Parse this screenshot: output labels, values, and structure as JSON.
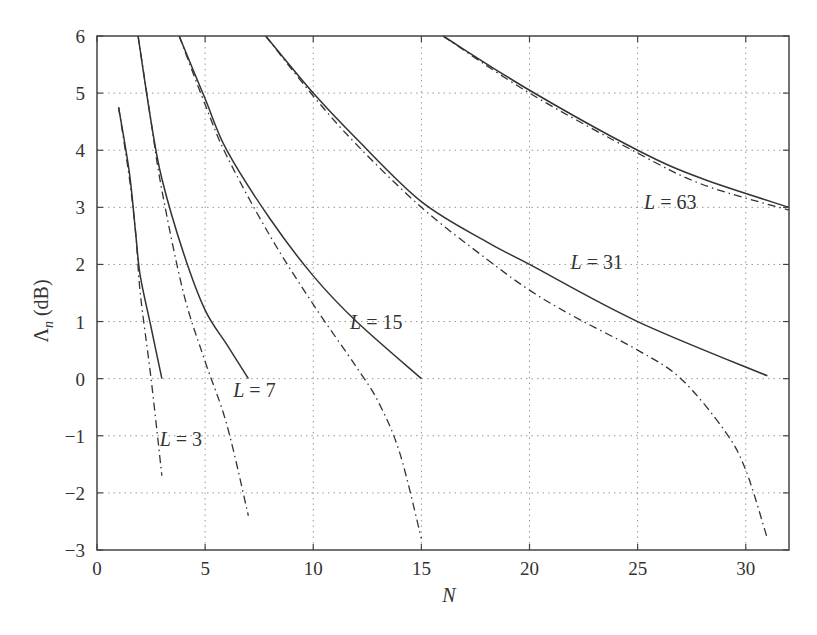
{
  "chart_data": {
    "type": "line",
    "title": "",
    "xlabel": "N",
    "ylabel": "Λn (dB)",
    "ylabel_main": "Λ",
    "ylabel_sub": "n",
    "ylabel_unit": " (dB)",
    "xlim": [
      0,
      32
    ],
    "ylim": [
      -3,
      6
    ],
    "grid": true,
    "xticks": [
      0,
      5,
      10,
      15,
      20,
      25,
      30
    ],
    "yticks": [
      -3,
      -2,
      -1,
      0,
      1,
      2,
      3,
      4,
      5,
      6
    ],
    "legend": "none (inline curve labels)",
    "series": [
      {
        "name": "L = 3",
        "style": "solid",
        "x": [
          1,
          1.5,
          1.8,
          2,
          2.5,
          3
        ],
        "y": [
          4.75,
          3.6,
          2.5,
          1.8,
          0.9,
          0
        ]
      },
      {
        "name": "L = 3 (dash-dot)",
        "style": "dashdot",
        "x": [
          1,
          1.5,
          1.8,
          2,
          2.5,
          3
        ],
        "y": [
          4.75,
          3.5,
          2.5,
          1.5,
          0,
          -1.7
        ]
      },
      {
        "name": "L = 7",
        "style": "solid",
        "x": [
          1.9,
          2.5,
          3,
          4,
          5,
          6,
          7
        ],
        "y": [
          6,
          4.5,
          3.5,
          2.2,
          1.2,
          0.6,
          0
        ]
      },
      {
        "name": "L = 7 (dash-dot)",
        "style": "dashdot",
        "x": [
          1.9,
          2.5,
          3,
          4,
          5,
          6,
          7
        ],
        "y": [
          6,
          4.5,
          3.3,
          1.5,
          0.3,
          -0.8,
          -2.4
        ]
      },
      {
        "name": "L = 15",
        "style": "solid",
        "x": [
          3.8,
          5,
          6,
          8,
          10,
          12,
          15
        ],
        "y": [
          6,
          4.9,
          4,
          2.8,
          1.8,
          1,
          0
        ]
      },
      {
        "name": "L = 15 (dash-dot)",
        "style": "dashdot",
        "x": [
          3.8,
          5,
          6,
          8,
          10,
          12,
          13,
          14,
          15
        ],
        "y": [
          6,
          4.8,
          3.9,
          2.5,
          1.3,
          0.2,
          -0.4,
          -1.3,
          -2.8
        ]
      },
      {
        "name": "L = 31",
        "style": "solid",
        "x": [
          7.8,
          10,
          12,
          15,
          18,
          20,
          25,
          31
        ],
        "y": [
          6,
          5,
          4.2,
          3.1,
          2.4,
          2,
          1,
          0.05
        ]
      },
      {
        "name": "L = 31 (dash-dot)",
        "style": "dashdot",
        "x": [
          7.8,
          10,
          12,
          15,
          18,
          20,
          22,
          25,
          27,
          29,
          30,
          31
        ],
        "y": [
          6,
          4.95,
          4.1,
          3.0,
          2.1,
          1.55,
          1.1,
          0.5,
          0,
          -0.9,
          -1.6,
          -2.8
        ]
      },
      {
        "name": "L = 63",
        "style": "solid",
        "x": [
          16,
          20,
          25,
          28,
          32
        ],
        "y": [
          6,
          5.05,
          4,
          3.5,
          3.0
        ]
      },
      {
        "name": "L = 63 (dash-dot)",
        "style": "dashdot",
        "x": [
          16,
          20,
          25,
          28,
          32
        ],
        "y": [
          6,
          5,
          3.95,
          3.4,
          2.95
        ]
      }
    ],
    "annotations": [
      {
        "text": "L = 3",
        "italic_part": "L",
        "rest": " = 3",
        "x": 2.9,
        "y": -1.05
      },
      {
        "text": "L = 7",
        "italic_part": "L",
        "rest": " = 7",
        "x": 6.3,
        "y": -0.2
      },
      {
        "text": "L = 15",
        "italic_part": "L",
        "rest": " = 15",
        "x": 11.7,
        "y": 1.0
      },
      {
        "text": "L = 31",
        "italic_part": "L",
        "rest": " = 31",
        "x": 21.9,
        "y": 2.05
      },
      {
        "text": "L = 63",
        "italic_part": "L",
        "rest": " = 63",
        "x": 25.3,
        "y": 3.1
      }
    ]
  }
}
